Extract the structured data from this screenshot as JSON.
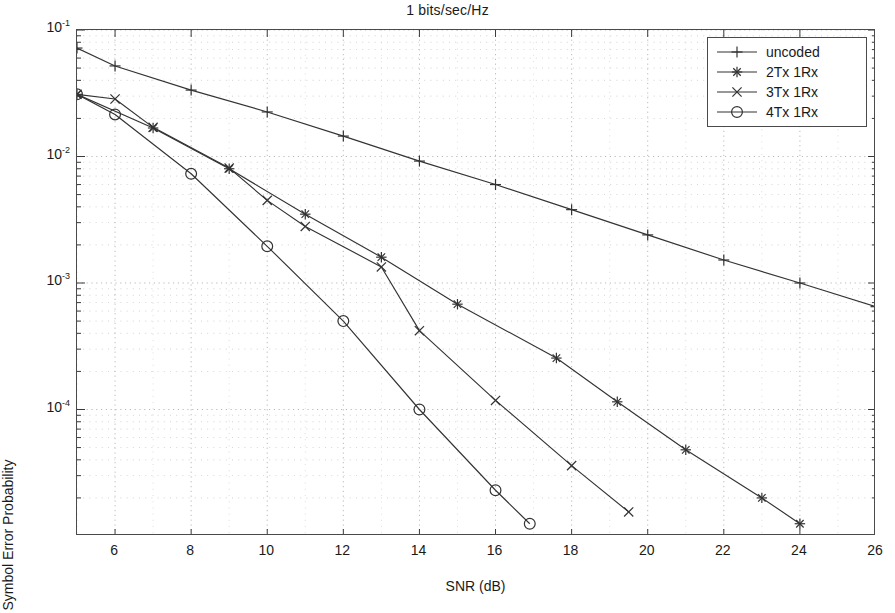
{
  "chart_data": {
    "type": "line",
    "title": "1 bits/sec/Hz",
    "xlabel": "SNR (dB)",
    "ylabel": "Symbol Error Probability",
    "xscale": "linear",
    "yscale": "log",
    "xlim": [
      5,
      26
    ],
    "ylim": [
      1e-05,
      0.1
    ],
    "grid": true,
    "grid_style": "dotted-minor-and-major",
    "legend_position": "top-right",
    "xticks": [
      6,
      8,
      10,
      12,
      14,
      16,
      18,
      20,
      22,
      24,
      26
    ],
    "xtick_labels": [
      "6",
      "8",
      "10",
      "12",
      "14",
      "16",
      "18",
      "20",
      "22",
      "24",
      "26"
    ],
    "yticks": [
      0.1,
      0.01,
      0.001,
      0.0001
    ],
    "ytick_labels": [
      "10-1",
      "10-2",
      "10-3",
      "10-4"
    ],
    "ytick_mantissa": "10",
    "ytick_exponents": [
      "-1",
      "-2",
      "-3",
      "-4"
    ],
    "series": [
      {
        "name": "uncoded",
        "marker": "plus",
        "color": "#333333",
        "x": [
          5,
          6,
          8,
          10,
          12,
          14,
          16,
          18,
          20,
          22,
          24,
          26
        ],
        "y": [
          0.072,
          0.052,
          0.0335,
          0.0225,
          0.0145,
          0.0092,
          0.006,
          0.0038,
          0.0024,
          0.00152,
          0.001,
          0.00065
        ]
      },
      {
        "name": "2Tx 1Rx",
        "marker": "star",
        "color": "#333333",
        "x": [
          5,
          7,
          9,
          11,
          13,
          15,
          17.6,
          19.2,
          21,
          23,
          24
        ],
        "y": [
          0.031,
          0.0168,
          0.008,
          0.0035,
          0.0016,
          0.00068,
          0.000255,
          0.000115,
          4.8e-05,
          2e-05,
          1.25e-05
        ]
      },
      {
        "name": "3Tx 1Rx",
        "marker": "cross",
        "color": "#333333",
        "x": [
          5,
          6,
          7,
          9,
          10,
          11,
          13,
          14,
          16,
          18,
          19.5
        ],
        "y": [
          0.031,
          0.0285,
          0.017,
          0.0081,
          0.0045,
          0.0028,
          0.00134,
          0.00042,
          0.000118,
          3.6e-05,
          1.55e-05
        ]
      },
      {
        "name": "4Tx 1Rx",
        "marker": "circle",
        "color": "#333333",
        "x": [
          5,
          6,
          8,
          10,
          12,
          14,
          16,
          16.9
        ],
        "y": [
          0.031,
          0.0215,
          0.0073,
          0.00195,
          0.0005,
          0.0001,
          2.3e-05,
          1.25e-05
        ]
      }
    ]
  },
  "legend": {
    "items": [
      {
        "label": "uncoded",
        "marker": "plus"
      },
      {
        "label": "2Tx 1Rx",
        "marker": "star"
      },
      {
        "label": "3Tx 1Rx",
        "marker": "cross"
      },
      {
        "label": "4Tx 1Rx",
        "marker": "circle"
      }
    ]
  }
}
